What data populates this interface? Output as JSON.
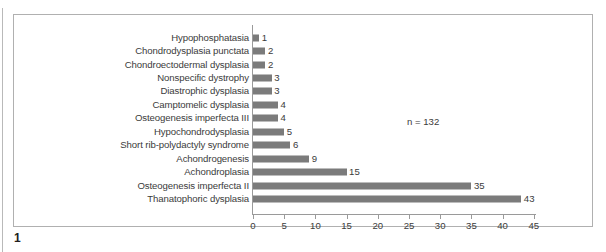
{
  "figure": {
    "number": "1",
    "annotation": "n = 132"
  },
  "chart_data": {
    "type": "bar",
    "orientation": "horizontal",
    "title": "",
    "subtitle": "",
    "xlabel": "",
    "ylabel": "",
    "xlim": [
      0,
      45
    ],
    "xticks": [
      0,
      5,
      10,
      15,
      20,
      25,
      30,
      35,
      40,
      45
    ],
    "xtick_labels": [
      "0",
      "5",
      "10",
      "15",
      "20",
      "25",
      "30",
      "35",
      "40",
      "45"
    ],
    "grid": false,
    "legend": false,
    "annotations": [
      "n = 132"
    ],
    "bar_color": "#7b7b7b",
    "axis_color": "#9a9a9a",
    "text_color": "#3b3b3b",
    "categories": [
      "Hypophosphatasia",
      "Chondrodysplasia punctata",
      "Chondroectodermal dysplasia",
      "Nonspecific dystrophy",
      "Diastrophic dysplasia",
      "Camptomelic dysplasia",
      "Osteogenesis imperfecta III",
      "Hypochondrodysplasia",
      "Short rib-polydactyly syndrome",
      "Achondrogenesis",
      "Achondroplasia",
      "Osteogenesis imperfecta II",
      "Thanatophoric dysplasia"
    ],
    "values": [
      1,
      2,
      2,
      3,
      3,
      4,
      4,
      5,
      6,
      9,
      15,
      35,
      43
    ],
    "value_labels": [
      "1",
      "2",
      "2",
      "3",
      "3",
      "4",
      "4",
      "5",
      "6",
      "9",
      "15",
      "35",
      "43"
    ]
  }
}
